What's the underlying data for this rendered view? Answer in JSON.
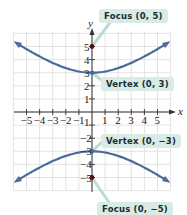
{
  "chart_data": {
    "type": "line",
    "title": "",
    "xlabel": "x",
    "ylabel": "y",
    "xlim": [
      -6,
      6
    ],
    "ylim": [
      -6,
      6
    ],
    "grid": true,
    "x_ticks": [
      -5,
      -4,
      -3,
      -2,
      -1,
      1,
      2,
      3,
      4,
      5
    ],
    "y_ticks": [
      -5,
      -4,
      -3,
      -2,
      2,
      3,
      4,
      5
    ],
    "x_tick_labels": [
      "−5",
      "−4",
      "−3",
      "−2",
      "−1",
      "1",
      "2",
      "3",
      "4",
      "5"
    ],
    "y_tick_labels": [
      "−5",
      "−4",
      "−3",
      "−2",
      "1",
      "2",
      "3",
      "4",
      "5"
    ],
    "series": [
      {
        "name": "upper branch",
        "equation": "y^2/9 - x^2/16 = 1 (upper)",
        "x": [
          -5.9,
          -4,
          -2,
          0,
          2,
          4,
          5.9
        ],
        "y": [
          5.3,
          4.24,
          3.35,
          3,
          3.35,
          4.24,
          5.3
        ]
      },
      {
        "name": "lower branch",
        "equation": "y^2/9 - x^2/16 = 1 (lower)",
        "x": [
          -5.9,
          -4,
          -2,
          0,
          2,
          4,
          5.9
        ],
        "y": [
          -5.3,
          -4.24,
          -3.35,
          -3,
          -3.35,
          -4.24,
          -5.3
        ]
      }
    ],
    "points": [
      {
        "label": "Focus (0, 5)",
        "x": 0,
        "y": 5
      },
      {
        "label": "Vertex (0, 3)",
        "x": 0,
        "y": 3
      },
      {
        "label": "Vertex (0, −3)",
        "x": 0,
        "y": -3
      },
      {
        "label": "Focus (0, −5)",
        "x": 0,
        "y": -5
      }
    ],
    "annotations": [
      "Focus (0, 5)",
      "Vertex (0, 3)",
      "Vertex (0, −3)",
      "Focus (0, −5)"
    ]
  },
  "labels": {
    "focus_top": "Focus (0, 5)",
    "vertex_top": "Vertex (0, 3)",
    "vertex_bottom": "Vertex (0, −3)",
    "focus_bottom": "Focus (0, −5)",
    "x_axis": "x",
    "y_axis": "y"
  },
  "colors": {
    "curve": "#4a6b9a",
    "grid": "#dcdcdc",
    "axis": "#333333",
    "point": "#5a1010",
    "callout_bg": "#d8ebe4",
    "leader": "#b9ddd6"
  }
}
